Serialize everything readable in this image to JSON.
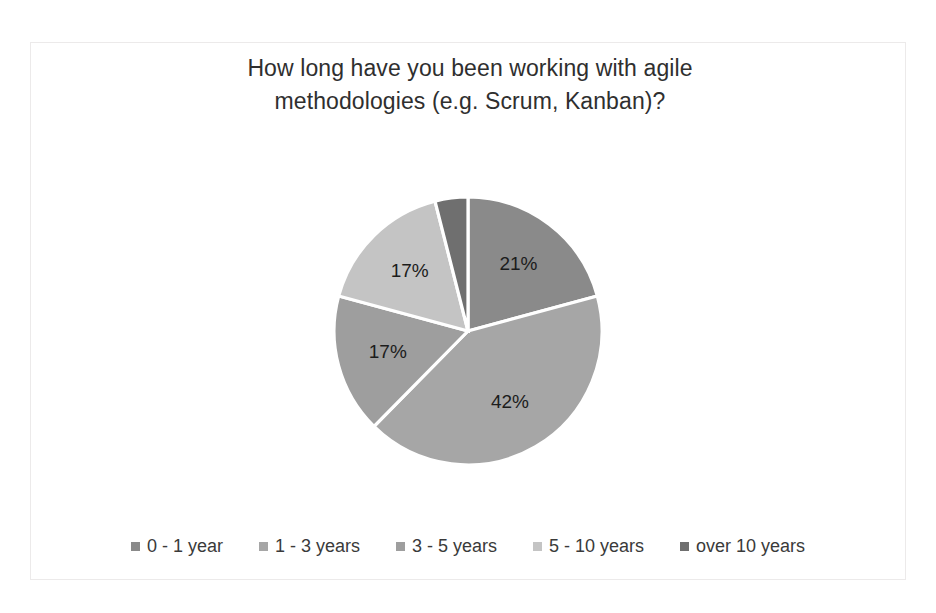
{
  "chart_data": {
    "type": "pie",
    "title": "How long have you been working with agile methodologies (e.g. Scrum, Kanban)?",
    "title_lines": [
      "How long have you been working with agile",
      "methodologies (e.g. Scrum, Kanban)?"
    ],
    "categories": [
      "0 - 1 year",
      "1 - 3 years",
      "3 - 5 years",
      "5 - 10 years",
      "over 10 years"
    ],
    "values": [
      21,
      42,
      17,
      17,
      4
    ],
    "value_labels": [
      "21%",
      "42%",
      "17%",
      "17%",
      "4%"
    ],
    "colors": [
      "#8a8a8a",
      "#a6a6a6",
      "#9e9e9e",
      "#c4c4c4",
      "#6f6f6f"
    ],
    "slice_border_color": "#ffffff",
    "start_angle_deg": 0,
    "direction": "clockwise",
    "legend_position": "bottom",
    "grid": false,
    "xlabel": "",
    "ylabel": "",
    "slices": [
      {
        "label": "0 - 1 year",
        "value": 21,
        "value_label": "21%",
        "color": "#8a8a8a",
        "label_inside": true
      },
      {
        "label": "1 - 3 years",
        "value": 42,
        "value_label": "42%",
        "color": "#a6a6a6",
        "label_inside": true
      },
      {
        "label": "3 - 5 years",
        "value": 17,
        "value_label": "17%",
        "color": "#9e9e9e",
        "label_inside": true
      },
      {
        "label": "5 - 10 years",
        "value": 17,
        "value_label": "17%",
        "color": "#c4c4c4",
        "label_inside": true
      },
      {
        "label": "over 10 years",
        "value": 4,
        "value_label": "4%",
        "color": "#6f6f6f",
        "label_inside": false
      }
    ]
  },
  "legend": {
    "items": [
      {
        "label": "0 - 1 year",
        "color": "#8a8a8a"
      },
      {
        "label": "1 - 3 years",
        "color": "#a6a6a6"
      },
      {
        "label": "3 - 5 years",
        "color": "#9e9e9e"
      },
      {
        "label": "5 - 10 years",
        "color": "#c4c4c4"
      },
      {
        "label": "over 10 years",
        "color": "#6f6f6f"
      }
    ]
  }
}
